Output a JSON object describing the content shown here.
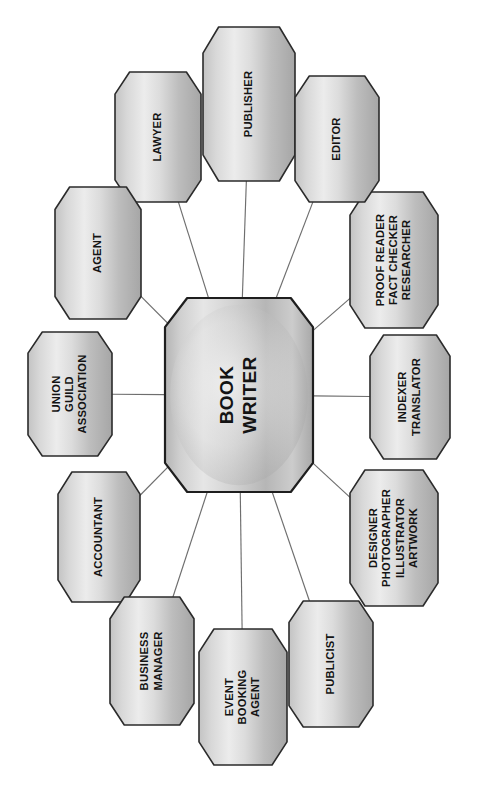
{
  "chart_data": {
    "type": "diagram",
    "subtype": "radial hub-and-spoke mind map",
    "orientation": "rotated 90 degrees clockwise; all text reads bottom-to-top",
    "background_color": "#ffffff",
    "node_fill_light": "#e9e9e9",
    "node_fill_dark": "#a9a9a9",
    "node_stroke": "#2b2b2b",
    "spoke_color": "#6e6e6e",
    "text_color": "#141414",
    "center": {
      "id": "book-writer",
      "lines": [
        "BOOK",
        "WRITER"
      ],
      "x": 239,
      "y": 395,
      "rx": 74,
      "ry": 97
    },
    "satellite_count": 12,
    "satellites": [
      {
        "id": "publisher",
        "lines": [
          "PUBLISHER"
        ],
        "x": 249,
        "y": 104,
        "rx": 46,
        "ry": 77,
        "angle_deg": 90
      },
      {
        "id": "lawyer",
        "lines": [
          "LAWYER"
        ],
        "x": 158,
        "y": 137,
        "rx": 43,
        "ry": 65,
        "angle_deg": 120
      },
      {
        "id": "agent",
        "lines": [
          "AGENT"
        ],
        "x": 98,
        "y": 253,
        "rx": 43,
        "ry": 66,
        "angle_deg": 150
      },
      {
        "id": "union-guild-association",
        "lines": [
          "UNION",
          "GUILD",
          "ASSOCIATION"
        ],
        "x": 70,
        "y": 394,
        "rx": 42,
        "ry": 62,
        "angle_deg": 180
      },
      {
        "id": "accountant",
        "lines": [
          "ACCOUNTANT"
        ],
        "x": 99,
        "y": 537,
        "rx": 41,
        "ry": 65,
        "angle_deg": 210
      },
      {
        "id": "business-manager",
        "lines": [
          "BUSINESS",
          "MANAGER"
        ],
        "x": 152,
        "y": 661,
        "rx": 42,
        "ry": 64,
        "angle_deg": 240
      },
      {
        "id": "event-booking-agent",
        "lines": [
          "EVENT",
          "BOOKING",
          "AGENT"
        ],
        "x": 243,
        "y": 697,
        "rx": 44,
        "ry": 68,
        "angle_deg": 270
      },
      {
        "id": "publicist",
        "lines": [
          "PUBLICIST"
        ],
        "x": 331,
        "y": 664,
        "rx": 42,
        "ry": 63,
        "angle_deg": 300
      },
      {
        "id": "designer-photographer-illustrator-artwork",
        "lines": [
          "DESIGNER",
          "PHOTOGRAPHER",
          "ILLUSTRATOR",
          "ARTWORK"
        ],
        "x": 394,
        "y": 538,
        "rx": 44,
        "ry": 68,
        "angle_deg": 330
      },
      {
        "id": "indexer-translator",
        "lines": [
          "INDEXER",
          "TRANSLATOR"
        ],
        "x": 410,
        "y": 397,
        "rx": 40,
        "ry": 62,
        "angle_deg": 0
      },
      {
        "id": "proof-reader-fact-checker-researcher",
        "lines": [
          "PROOF READER",
          "FACT CHECKER",
          "RESEARCHER"
        ],
        "x": 394,
        "y": 260,
        "rx": 44,
        "ry": 68,
        "angle_deg": 30
      },
      {
        "id": "editor",
        "lines": [
          "EDITOR"
        ],
        "x": 337,
        "y": 139,
        "rx": 42,
        "ry": 63,
        "angle_deg": 60
      }
    ],
    "edges": [
      {
        "from": "book-writer",
        "to": "publisher"
      },
      {
        "from": "book-writer",
        "to": "lawyer"
      },
      {
        "from": "book-writer",
        "to": "agent"
      },
      {
        "from": "book-writer",
        "to": "union-guild-association"
      },
      {
        "from": "book-writer",
        "to": "accountant"
      },
      {
        "from": "book-writer",
        "to": "business-manager"
      },
      {
        "from": "book-writer",
        "to": "event-booking-agent"
      },
      {
        "from": "book-writer",
        "to": "publicist"
      },
      {
        "from": "book-writer",
        "to": "designer-photographer-illustrator-artwork"
      },
      {
        "from": "book-writer",
        "to": "indexer-translator"
      },
      {
        "from": "book-writer",
        "to": "proof-reader-fact-checker-researcher"
      },
      {
        "from": "book-writer",
        "to": "editor"
      }
    ]
  }
}
